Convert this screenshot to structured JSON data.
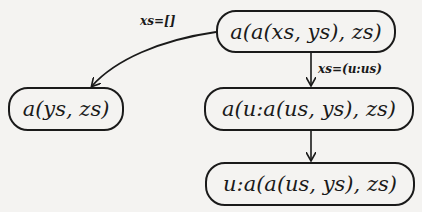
{
  "diagram": {
    "nodes": [
      {
        "id": "root",
        "label": "a(a(xs, ys), zs)"
      },
      {
        "id": "nil-case",
        "label": "a(ys, zs)"
      },
      {
        "id": "cons-case",
        "label": "a(u:a(us, ys), zs)"
      },
      {
        "id": "result",
        "label": "u:a(a(us, ys), zs)"
      }
    ],
    "edges": [
      {
        "from": "root",
        "to": "nil-case",
        "label": "xs=[]"
      },
      {
        "from": "root",
        "to": "cons-case",
        "label": "xs=(u:us)"
      },
      {
        "from": "cons-case",
        "to": "result",
        "label": ""
      }
    ]
  }
}
